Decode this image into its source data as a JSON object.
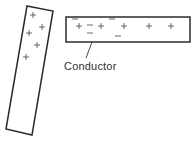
{
  "diagram": {
    "colors": {
      "stroke": "#2b2b2b",
      "text": "#333333",
      "background": "#ffffff"
    },
    "rod": {
      "description": "tilted charged rod",
      "corners": [
        [
          27,
          6
        ],
        [
          53,
          11
        ],
        [
          32,
          135
        ],
        [
          6,
          129
        ]
      ],
      "charges": [
        {
          "sign": "+",
          "x": 33,
          "y": 15
        },
        {
          "sign": "+",
          "x": 42,
          "y": 27
        },
        {
          "sign": "+",
          "x": 29,
          "y": 33
        },
        {
          "sign": "+",
          "x": 37,
          "y": 45
        },
        {
          "sign": "+",
          "x": 26,
          "y": 57
        }
      ]
    },
    "conductor": {
      "label": "Conductor",
      "box": {
        "x": 66,
        "y": 17,
        "width": 124,
        "height": 25
      },
      "leader": [
        [
          92,
          42
        ],
        [
          86,
          58
        ]
      ],
      "charges": [
        {
          "sign": "−",
          "x": 75,
          "y": 19
        },
        {
          "sign": "−",
          "x": 112,
          "y": 19
        },
        {
          "sign": "+",
          "x": 79,
          "y": 26
        },
        {
          "sign": "−",
          "x": 90,
          "y": 25
        },
        {
          "sign": "+",
          "x": 101,
          "y": 26
        },
        {
          "sign": "−",
          "x": 90,
          "y": 33
        },
        {
          "sign": "+",
          "x": 124,
          "y": 26
        },
        {
          "sign": "−",
          "x": 118,
          "y": 36
        },
        {
          "sign": "+",
          "x": 149,
          "y": 26
        },
        {
          "sign": "+",
          "x": 171,
          "y": 26
        }
      ]
    }
  }
}
